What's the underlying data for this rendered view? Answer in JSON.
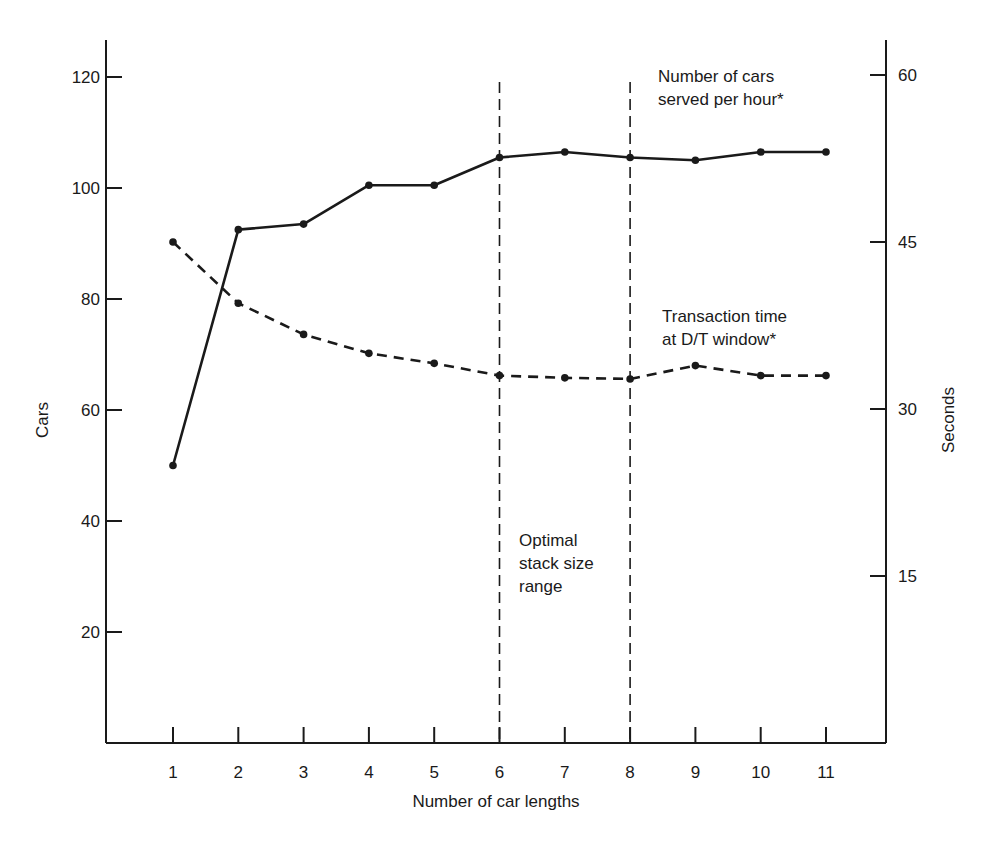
{
  "chart_data": {
    "type": "line",
    "title": "",
    "xlabel": "Number of car lengths",
    "ylabel": "Cars",
    "y2label": "Seconds",
    "categories": [
      1,
      2,
      3,
      4,
      5,
      6,
      7,
      8,
      9,
      10,
      11
    ],
    "x_ticks": [
      "1",
      "2",
      "3",
      "4",
      "5",
      "6",
      "7",
      "8",
      "9",
      "10",
      "11"
    ],
    "ylim": [
      0,
      128
    ],
    "y_ticks": [
      20,
      40,
      60,
      80,
      100,
      120
    ],
    "y2lim": [
      0,
      64
    ],
    "y2_ticks": [
      15,
      30,
      45,
      60
    ],
    "grid": false,
    "legend": "inline annotations",
    "series": [
      {
        "name": "Number of cars served per hour*",
        "axis": "left",
        "style": "solid",
        "values": [
          50,
          92.5,
          93.5,
          100.5,
          100.5,
          105.5,
          106.5,
          105.5,
          105,
          106.5,
          106.5
        ]
      },
      {
        "name": "Transaction time at D/T window*",
        "axis": "right",
        "style": "dashed",
        "values": [
          45,
          39.5,
          36.7,
          35,
          34.1,
          33,
          32.8,
          32.7,
          33.9,
          33,
          33
        ]
      }
    ],
    "annotations": [
      {
        "text": [
          "Number of cars",
          "served per hour*"
        ],
        "target": "series.0"
      },
      {
        "text": [
          "Transaction time",
          "at D/T window*"
        ],
        "target": "series.1"
      },
      {
        "text": [
          "Optimal",
          "stack size",
          "range"
        ],
        "region_x": [
          6,
          8
        ]
      }
    ],
    "vertical_reference_lines": [
      6,
      8
    ],
    "colors": {
      "ink": "#1a1a1a",
      "background": "#ffffff"
    }
  }
}
